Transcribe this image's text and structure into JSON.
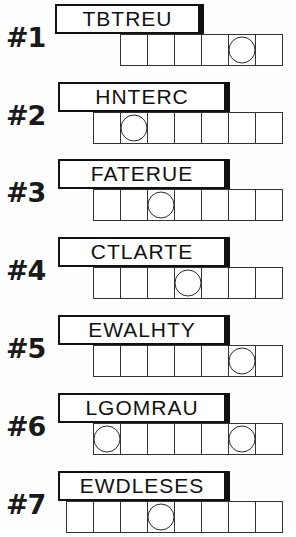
{
  "sheet": {
    "title": "Word Scramble Puzzle Worksheet",
    "puzzle_count": 7,
    "cell_width_px": 28,
    "strip_right_edge_px": 283
  },
  "puzzles": [
    {
      "number_label": "#1",
      "scrambled_word": "TBTREU",
      "letter_count": 6,
      "box_count": 6,
      "circled_positions": [
        5
      ],
      "banner_left_px": 55,
      "banner_width_px": 145,
      "top_px": 4
    },
    {
      "number_label": "#2",
      "scrambled_word": "HNTERC",
      "letter_count": 6,
      "box_count": 7,
      "circled_positions": [
        2
      ],
      "banner_left_px": 58,
      "banner_width_px": 168,
      "top_px": 82
    },
    {
      "number_label": "#3",
      "scrambled_word": "FATERUE",
      "letter_count": 7,
      "box_count": 7,
      "circled_positions": [
        3
      ],
      "banner_left_px": 58,
      "banner_width_px": 168,
      "top_px": 159
    },
    {
      "number_label": "#4",
      "scrambled_word": "CTLARTE",
      "letter_count": 7,
      "box_count": 7,
      "circled_positions": [
        4
      ],
      "banner_left_px": 58,
      "banner_width_px": 168,
      "top_px": 237
    },
    {
      "number_label": "#5",
      "scrambled_word": "EWALHTY",
      "letter_count": 7,
      "box_count": 7,
      "circled_positions": [
        6
      ],
      "banner_left_px": 58,
      "banner_width_px": 168,
      "top_px": 315
    },
    {
      "number_label": "#6",
      "scrambled_word": "LGOMRAU",
      "letter_count": 7,
      "box_count": 7,
      "circled_positions": [
        1,
        6
      ],
      "banner_left_px": 58,
      "banner_width_px": 168,
      "top_px": 393
    },
    {
      "number_label": "#7",
      "scrambled_word": "EWDLESES",
      "letter_count": 8,
      "box_count": 8,
      "circled_positions": [
        4
      ],
      "banner_left_px": 58,
      "banner_width_px": 168,
      "top_px": 471
    }
  ],
  "colors": {
    "ink": "#111111",
    "grid_line": "#333333",
    "paper": "#fefefe"
  }
}
